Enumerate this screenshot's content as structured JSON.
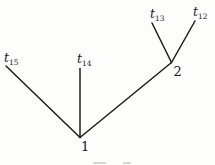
{
  "figure": {
    "background_color": "#fdfdfc",
    "line_color": "#1c1c1c",
    "text_color": "#1b1b1b"
  },
  "diagram": {
    "type": "tree",
    "leaves": [
      {
        "base": "t",
        "sub": "15"
      },
      {
        "base": "t",
        "sub": "14"
      },
      {
        "base": "t",
        "sub": "13"
      },
      {
        "base": "t",
        "sub": "12"
      }
    ],
    "internal_nodes": [
      {
        "label": "1"
      },
      {
        "label": "2"
      }
    ],
    "edges": [
      {
        "from": "1",
        "to": "t15"
      },
      {
        "from": "1",
        "to": "t14"
      },
      {
        "from": "1",
        "to": "2"
      },
      {
        "from": "2",
        "to": "t13"
      },
      {
        "from": "2",
        "to": "t12"
      }
    ]
  }
}
